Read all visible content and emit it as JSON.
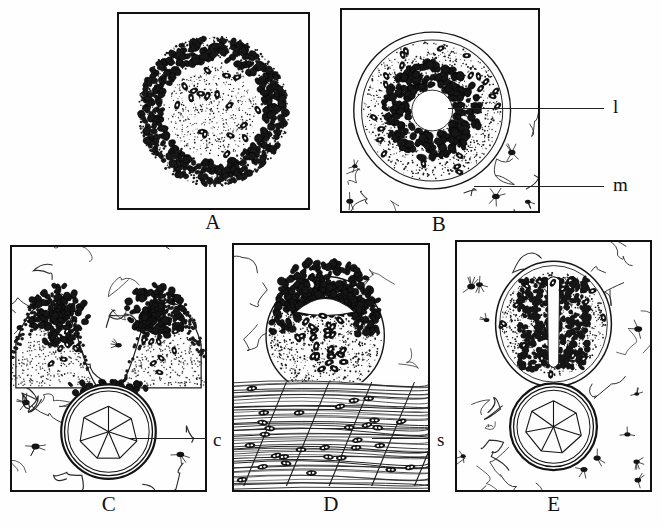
{
  "figure": {
    "background_color": "#fefefe",
    "ink_color": "#111111",
    "panel_count": 5
  },
  "panels": [
    {
      "id": "A",
      "letter": "A",
      "caption": "A",
      "description": "Solid spherical cell mass; dark stippled epithelial cells form a thick ring around a pale granular core with scattered dark nuclei.",
      "frame": {
        "x": 117,
        "y": 12,
        "w": 193,
        "h": 198
      },
      "letter_pos": {
        "x": 198,
        "y": 212
      },
      "features": [
        "solid-cell-mass",
        "stippled-cortex",
        "pale-core",
        "scattered-nuclei"
      ],
      "labels": []
    },
    {
      "id": "B",
      "letter": "B",
      "caption": "B",
      "description": "Spherical follicle with a central clear lumen ringed by dark columnar epithelial cells, enclosed by a basement membrane and surrounded by loose mesenchyme with stellate cells.",
      "frame": {
        "x": 340,
        "y": 8,
        "w": 200,
        "h": 205
      },
      "letter_pos": {
        "x": 424,
        "y": 214
      },
      "features": [
        "follicle",
        "central-lumen",
        "columnar-epithelium",
        "basement-membrane",
        "mesenchyme",
        "stellate-cells"
      ],
      "labels": [
        {
          "key": "l",
          "text": "l",
          "meaning": "lumen",
          "text_pos": {
            "x": 613,
            "y": 97
          },
          "leader": {
            "x1": 448,
            "y1": 108,
            "x2": 604,
            "y2": 108
          }
        },
        {
          "key": "m",
          "text": "m",
          "meaning": "mesenchyme",
          "text_pos": {
            "x": 613,
            "y": 175
          },
          "leader": {
            "x1": 474,
            "y1": 186,
            "x2": 604,
            "y2": 186
          }
        }
      ]
    },
    {
      "id": "C",
      "letter": "C",
      "caption": "C",
      "description": "U-shaped epithelial invagination forming two dark lobes above a ring of large polygonal cartilage cells encircled by a perichondrium; mesenchyme fills the surrounding space.",
      "frame": {
        "x": 10,
        "y": 245,
        "w": 197,
        "h": 247
      },
      "letter_pos": {
        "x": 94,
        "y": 494
      },
      "features": [
        "invagination",
        "paired-lobes",
        "cartilage-ring",
        "polygonal-chondrocytes",
        "perichondrium",
        "mesenchyme"
      ],
      "labels": [
        {
          "key": "c",
          "text": "c",
          "meaning": "cartilage",
          "text_pos": {
            "x": 213,
            "y": 430
          },
          "leader": {
            "x1": 128,
            "y1": 438,
            "x2": 207,
            "y2": 438
          }
        }
      ]
    },
    {
      "id": "D",
      "letter": "D",
      "caption": "D",
      "description": "Rounded cell mass with a broad flattened apical cavity and dark cells above a pale stippled base, resting on a bed of striated skeletal muscle fibres with elongated nuclei.",
      "frame": {
        "x": 232,
        "y": 243,
        "w": 198,
        "h": 249
      },
      "letter_pos": {
        "x": 316,
        "y": 494
      },
      "features": [
        "cell-mass",
        "flattened-cavity",
        "dark-apical-cells",
        "striated-muscle",
        "muscle-nuclei"
      ],
      "labels": [
        {
          "key": "s",
          "text": "s",
          "meaning": "striated muscle",
          "text_pos": {
            "x": 437,
            "y": 430
          },
          "leader": {
            "x1": 372,
            "y1": 438,
            "x2": 430,
            "y2": 438
          }
        }
      ]
    },
    {
      "id": "E",
      "letter": "E",
      "caption": "E",
      "description": "Ovoid follicle with a narrow vertical slit-like lumen flanked by dark epithelial cells, sitting directly on a ring of polygonal cartilage cells; stellate mesenchyme surrounds both.",
      "frame": {
        "x": 455,
        "y": 240,
        "w": 197,
        "h": 252
      },
      "letter_pos": {
        "x": 539,
        "y": 494
      },
      "features": [
        "ovoid-follicle",
        "slit-lumen",
        "dark-epithelium",
        "cartilage-ring",
        "polygonal-chondrocytes",
        "mesenchyme"
      ],
      "labels": []
    }
  ],
  "legend": {
    "l": "lumen",
    "m": "mesenchyme",
    "c": "cartilage",
    "s": "striated muscle"
  }
}
